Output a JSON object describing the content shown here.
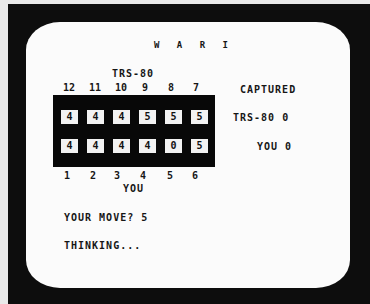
{
  "game": {
    "title": "W A R I",
    "cpu_label": "TRS-80",
    "player_label": "YOU",
    "cpu_pit_numbers": [
      "12",
      "11",
      "10",
      "9",
      "8",
      "7"
    ],
    "player_pit_numbers": [
      "1",
      "2",
      "3",
      "4",
      "5",
      "6"
    ],
    "board": {
      "cpu_row": [
        "4",
        "4",
        "4",
        "5",
        "5",
        "5"
      ],
      "player_row": [
        "4",
        "4",
        "4",
        "4",
        "0",
        "5"
      ]
    },
    "captured": {
      "heading": "CAPTURED",
      "cpu": "TRS-80 0",
      "player": "YOU 0"
    },
    "prompt": "YOUR MOVE? 5",
    "status": "THINKING..."
  },
  "colors": {
    "screen": "#fbfbfb",
    "bezel": "#0d0d0d",
    "board": "#080808",
    "pit": "#f2f2f2",
    "text": "#161616"
  }
}
